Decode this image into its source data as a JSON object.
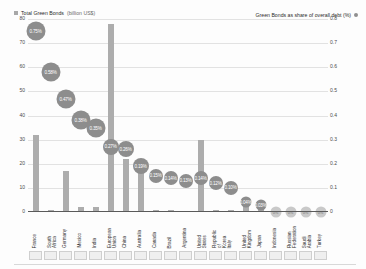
{
  "legend": {
    "left_label": "Total Green Bonds",
    "left_sub": "(billion US$)",
    "right_label": "Green Bonds as share of overall debt (%)"
  },
  "axes": {
    "left_ticks": [
      "80",
      "70",
      "60",
      "50",
      "40",
      "30",
      "20",
      "10",
      "0"
    ],
    "right_ticks": [
      "0.8",
      "0.7",
      "0.6",
      "0.5",
      "0.4",
      "0.3",
      "0.2",
      "0.1",
      "0"
    ]
  },
  "chart_data": {
    "type": "bar",
    "title": "",
    "xlabel": "",
    "ylabel": "Total Green Bonds (billion US$)",
    "y2label": "Green Bonds as share of overall debt (%)",
    "ylim": [
      0,
      80
    ],
    "y2lim": [
      0,
      0.8
    ],
    "grid": true,
    "legend_position": "top",
    "categories": [
      "France",
      "South Africa",
      "Germany",
      "Mexico",
      "India",
      "European Union",
      "China",
      "Australia",
      "Canada",
      "Brazil",
      "Argentina",
      "United States",
      "Republic of Korea",
      "Italy",
      "United Kingdom",
      "Japan",
      "Indonesia",
      "Russian Federation",
      "Saudi Arabia",
      "Turkey"
    ],
    "series": [
      {
        "name": "Total Green Bonds (billion US$)",
        "type": "bar",
        "axis": "left",
        "values": [
          32,
          1,
          17,
          2,
          2,
          78,
          22,
          22,
          1,
          1,
          0.5,
          30,
          1,
          1,
          4,
          2,
          0.5,
          1,
          0.3,
          0.3
        ]
      },
      {
        "name": "Green Bonds as share of overall debt (%)",
        "type": "bubble",
        "axis": "right",
        "values": [
          0.75,
          0.58,
          0.47,
          0.38,
          0.35,
          0.27,
          0.26,
          0.19,
          0.15,
          0.14,
          0.13,
          0.14,
          0.12,
          0.1,
          0.04,
          0.03,
          0.0,
          0.0,
          0.0,
          0.0
        ],
        "labels": [
          "0.75%",
          "0.58%",
          "0.47%",
          "0.38%",
          "0.35%",
          "0.27%",
          "0.26%",
          "0.19%",
          "0.15%",
          "0.14%",
          "0.13%",
          "0.14%",
          "0.12%",
          "0.10%",
          "0.04%",
          "0.03%",
          "0%",
          "0%",
          "0%",
          "0%"
        ]
      }
    ]
  },
  "colors": {
    "bar": "#adadad",
    "bubble": "#8d8d8d",
    "grid": "#e2e2e2",
    "axis": "#5a5a5a"
  }
}
